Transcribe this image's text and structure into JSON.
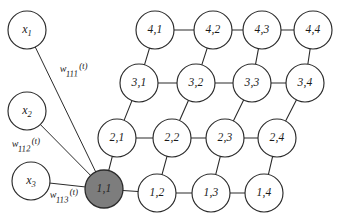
{
  "figure": {
    "type": "neural-network-diagram",
    "background_color": "#ffffff",
    "node_stroke_color": "#2b2b2b",
    "node_fill_color": "#ffffff",
    "highlight_fill_color": "#7d7d7d"
  },
  "inputs": [
    {
      "id": "x1",
      "symbol": "x",
      "subscript": "1",
      "cx": 27,
      "cy": 30,
      "r": 19
    },
    {
      "id": "x2",
      "symbol": "x",
      "subscript": "2",
      "cx": 27,
      "cy": 111,
      "r": 19
    },
    {
      "id": "x3",
      "symbol": "x",
      "subscript": "3",
      "cx": 31,
      "cy": 181,
      "r": 19
    }
  ],
  "weights": [
    {
      "id": "w111",
      "symbol": "w",
      "subscript": "111",
      "time": "(t)",
      "x": 60,
      "y": 72,
      "rotate": -4
    },
    {
      "id": "w112",
      "symbol": "w",
      "subscript": "112",
      "time": "(t)",
      "x": 12,
      "y": 147,
      "rotate": -4
    },
    {
      "id": "w113",
      "symbol": "w",
      "subscript": "113",
      "time": "(t)",
      "x": 50,
      "y": 198,
      "rotate": -4
    }
  ],
  "lattice": {
    "radius": 19,
    "highlight_node": "1,1",
    "nodes": [
      {
        "id": "1,1",
        "label": "1,1",
        "row": 1,
        "col": 1,
        "cx": 104,
        "cy": 189,
        "highlight": true
      },
      {
        "id": "1,2",
        "label": "1,2",
        "row": 1,
        "col": 2,
        "cx": 157,
        "cy": 193,
        "highlight": false
      },
      {
        "id": "1,3",
        "label": "1,3",
        "row": 1,
        "col": 3,
        "cx": 211,
        "cy": 193,
        "highlight": false
      },
      {
        "id": "1,4",
        "label": "1,4",
        "row": 1,
        "col": 4,
        "cx": 264,
        "cy": 193,
        "highlight": false
      },
      {
        "id": "2,1",
        "label": "2,1",
        "row": 2,
        "col": 1,
        "cx": 117,
        "cy": 138,
        "highlight": false
      },
      {
        "id": "2,2",
        "label": "2,2",
        "row": 2,
        "col": 2,
        "cx": 172,
        "cy": 138,
        "highlight": false
      },
      {
        "id": "2,3",
        "label": "2,3",
        "row": 2,
        "col": 3,
        "cx": 225,
        "cy": 138,
        "highlight": false
      },
      {
        "id": "2,4",
        "label": "2,4",
        "row": 2,
        "col": 4,
        "cx": 277,
        "cy": 138,
        "highlight": false
      },
      {
        "id": "3,1",
        "label": "3,1",
        "row": 3,
        "col": 1,
        "cx": 139,
        "cy": 83,
        "highlight": false
      },
      {
        "id": "3,2",
        "label": "3,2",
        "row": 3,
        "col": 2,
        "cx": 196,
        "cy": 83,
        "highlight": false
      },
      {
        "id": "3,3",
        "label": "3,3",
        "row": 3,
        "col": 3,
        "cx": 252,
        "cy": 83,
        "highlight": false
      },
      {
        "id": "3,4",
        "label": "3,4",
        "row": 3,
        "col": 4,
        "cx": 305,
        "cy": 83,
        "highlight": false
      },
      {
        "id": "4,1",
        "label": "4,1",
        "row": 4,
        "col": 1,
        "cx": 155,
        "cy": 30,
        "highlight": false
      },
      {
        "id": "4,2",
        "label": "4,2",
        "row": 4,
        "col": 2,
        "cx": 213,
        "cy": 30,
        "highlight": false
      },
      {
        "id": "4,3",
        "label": "4,3",
        "row": 4,
        "col": 3,
        "cx": 262,
        "cy": 30,
        "highlight": false
      },
      {
        "id": "4,4",
        "label": "4,4",
        "row": 4,
        "col": 4,
        "cx": 313,
        "cy": 30,
        "highlight": false
      }
    ],
    "edges": [
      [
        "1,1",
        "1,2"
      ],
      [
        "1,2",
        "1,3"
      ],
      [
        "1,3",
        "1,4"
      ],
      [
        "2,1",
        "2,2"
      ],
      [
        "2,2",
        "2,3"
      ],
      [
        "2,3",
        "2,4"
      ],
      [
        "3,1",
        "3,2"
      ],
      [
        "3,2",
        "3,3"
      ],
      [
        "3,3",
        "3,4"
      ],
      [
        "4,1",
        "4,2"
      ],
      [
        "4,2",
        "4,3"
      ],
      [
        "4,3",
        "4,4"
      ],
      [
        "1,1",
        "2,1"
      ],
      [
        "1,2",
        "2,2"
      ],
      [
        "1,3",
        "2,3"
      ],
      [
        "1,4",
        "2,4"
      ],
      [
        "2,1",
        "3,1"
      ],
      [
        "2,2",
        "3,2"
      ],
      [
        "2,3",
        "3,3"
      ],
      [
        "2,4",
        "3,4"
      ],
      [
        "3,1",
        "4,1"
      ],
      [
        "3,2",
        "4,2"
      ],
      [
        "3,3",
        "4,3"
      ],
      [
        "3,4",
        "4,4"
      ]
    ],
    "input_edges": [
      {
        "from": "x1",
        "to": "1,1"
      },
      {
        "from": "x2",
        "to": "1,1"
      },
      {
        "from": "x3",
        "to": "1,1"
      }
    ]
  }
}
